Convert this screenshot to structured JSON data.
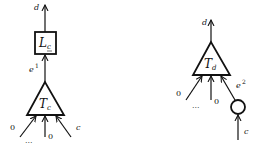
{
  "left": {
    "output_label": "d",
    "box_label": "L",
    "box_subscript": "c",
    "edge_label": "e",
    "edge_sup": "1",
    "triangle_label": "T",
    "triangle_sub": "c",
    "inputs": {
      "left": "0",
      "dots": "...",
      "middle": "0",
      "right": "c"
    }
  },
  "right": {
    "output_label": "d",
    "triangle_label": "T",
    "triangle_sub": "d",
    "edge_label": "e",
    "edge_sup": "2",
    "inputs": {
      "left": "0",
      "dots": "...",
      "middle": "0",
      "bottom": "c"
    }
  }
}
